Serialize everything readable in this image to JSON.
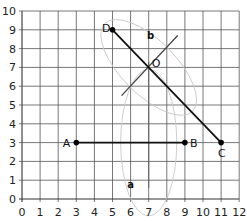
{
  "chart_data": {
    "type": "diagram",
    "title": "",
    "xlim": [
      0,
      12
    ],
    "ylim": [
      0,
      10
    ],
    "grid": true,
    "x_ticks": [
      "0",
      "1",
      "2",
      "3",
      "4",
      "5",
      "6",
      "7",
      "8",
      "9",
      "10",
      "11",
      "12"
    ],
    "y_ticks": [
      "0",
      "1",
      "2",
      "3",
      "4",
      "5",
      "6",
      "7",
      "8",
      "9",
      "10"
    ],
    "points": [
      {
        "name": "A",
        "x": 3,
        "y": 3
      },
      {
        "name": "B",
        "x": 9,
        "y": 3
      },
      {
        "name": "C",
        "x": 11,
        "y": 3
      },
      {
        "name": "D",
        "x": 5,
        "y": 9
      },
      {
        "name": "O",
        "x": 7,
        "y": 7
      }
    ],
    "segments": [
      {
        "from": "A",
        "to": "B"
      },
      {
        "from": "D",
        "to": "C"
      }
    ],
    "perpendicular_bisectors": [
      {
        "name": "a",
        "of": "AB",
        "x": 7,
        "label_pos": [
          6,
          0.6
        ]
      },
      {
        "name": "b",
        "of": "DC",
        "from": [
          5.5,
          5.5
        ],
        "to": [
          8.6,
          8.7
        ],
        "label_pos": [
          7.1,
          8.5
        ]
      }
    ],
    "labels": [
      "A",
      "B",
      "C",
      "D",
      "O",
      "a",
      "b"
    ]
  }
}
